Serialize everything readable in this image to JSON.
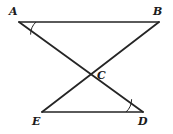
{
  "figure": {
    "kind": "geometry-diagram",
    "width": 173,
    "height": 134,
    "background_color": "#ffffff",
    "stroke_color": "#252525",
    "stroke_width": 1.6,
    "label_color": "#1b1b1b"
  },
  "points": {
    "A": {
      "label": "A",
      "x": 19,
      "y": 22,
      "label_x": 9,
      "label_y": 6
    },
    "B": {
      "label": "B",
      "x": 159,
      "y": 22,
      "label_x": 153,
      "label_y": 6
    },
    "C": {
      "label": "C",
      "x": 92,
      "y": 77,
      "label_x": 97,
      "label_y": 70
    },
    "E": {
      "label": "E",
      "x": 42,
      "y": 112,
      "label_x": 32,
      "label_y": 116
    },
    "D": {
      "label": "D",
      "x": 143,
      "y": 112,
      "label_x": 138,
      "label_y": 116
    }
  },
  "segments": [
    {
      "name": "AB",
      "from": "A",
      "to": "B",
      "x1": 19,
      "y1": 22,
      "x2": 159,
      "y2": 22
    },
    {
      "name": "AD",
      "from": "A",
      "to": "D",
      "x1": 19,
      "y1": 22,
      "x2": 143,
      "y2": 112
    },
    {
      "name": "EB",
      "from": "E",
      "to": "B",
      "x1": 42,
      "y1": 112,
      "x2": 159,
      "y2": 22
    },
    {
      "name": "ED",
      "from": "E",
      "to": "D",
      "x1": 42,
      "y1": 112,
      "x2": 143,
      "y2": 112
    }
  ],
  "angle_marks": [
    {
      "name": "angle-A",
      "vertex": "A",
      "path": "M 36 22 A 17 17 0 0 0 30.6 34.6"
    },
    {
      "name": "angle-D",
      "vertex": "D",
      "path": "M 126 112 A 17 17 0 0 0 131.6 99.2"
    }
  ]
}
